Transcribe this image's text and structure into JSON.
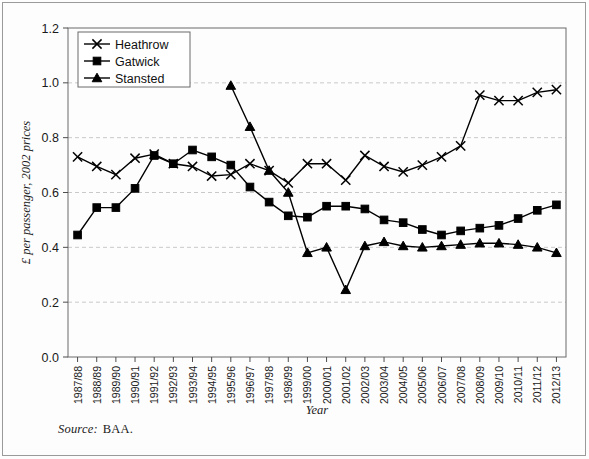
{
  "figure": {
    "title": "",
    "source_label": "Source:",
    "source_value": "BAA.",
    "background": "#ffffff",
    "line_color": "#000000",
    "grid_color": "#c9c9c9",
    "axis_color": "#4d4d4d"
  },
  "chart_data": {
    "type": "line",
    "title": "",
    "xlabel": "Year",
    "ylabel": "£ per passenger, 2002 prices",
    "ylim": [
      0.0,
      1.2
    ],
    "yticks": [
      "0.0",
      "0.2",
      "0.4",
      "0.6",
      "0.8",
      "1.0",
      "1.2"
    ],
    "ytick_values": [
      0.0,
      0.2,
      0.4,
      0.6,
      0.8,
      1.0,
      1.2
    ],
    "grid": "horizontal-dashed",
    "legend_position": "top-left",
    "categories": [
      "1987/88",
      "1988/89",
      "1989/90",
      "1990/91",
      "1991/92",
      "1992/93",
      "1993/94",
      "1994/95",
      "1995/96",
      "1996/97",
      "1997/98",
      "1998/99",
      "1999/00",
      "2000/01",
      "2001/02",
      "2002/03",
      "2003/04",
      "2004/05",
      "2005/06",
      "2006/07",
      "2007/08",
      "2008/09",
      "2009/10",
      "2010/11",
      "2011/12",
      "2012/13"
    ],
    "series": [
      {
        "name": "Heathrow",
        "marker": "x",
        "values": [
          0.73,
          0.695,
          0.665,
          0.725,
          0.74,
          0.705,
          0.695,
          0.66,
          0.665,
          0.705,
          0.68,
          0.635,
          0.705,
          0.705,
          0.645,
          0.735,
          0.695,
          0.675,
          0.7,
          0.73,
          0.77,
          0.955,
          0.935,
          0.935,
          0.965,
          0.975
        ]
      },
      {
        "name": "Gatwick",
        "marker": "square",
        "values": [
          0.445,
          0.545,
          0.545,
          0.615,
          0.735,
          0.705,
          0.755,
          0.73,
          0.7,
          0.62,
          0.565,
          0.515,
          0.51,
          0.55,
          0.55,
          0.54,
          0.5,
          0.49,
          0.465,
          0.445,
          0.46,
          0.47,
          0.48,
          0.505,
          0.535,
          0.555
        ]
      },
      {
        "name": "Stansted",
        "marker": "triangle",
        "values": [
          null,
          null,
          null,
          null,
          null,
          null,
          null,
          null,
          0.99,
          0.84,
          0.68,
          0.6,
          0.38,
          0.4,
          0.245,
          0.405,
          0.42,
          0.405,
          0.4,
          0.405,
          0.41,
          0.415,
          0.415,
          0.41,
          0.4,
          0.38
        ]
      }
    ]
  },
  "legend": {
    "items": [
      {
        "label": "Heathrow",
        "marker": "x-marker"
      },
      {
        "label": "Gatwick",
        "marker": "square-marker"
      },
      {
        "label": "Stansted",
        "marker": "triangle-marker"
      }
    ]
  }
}
